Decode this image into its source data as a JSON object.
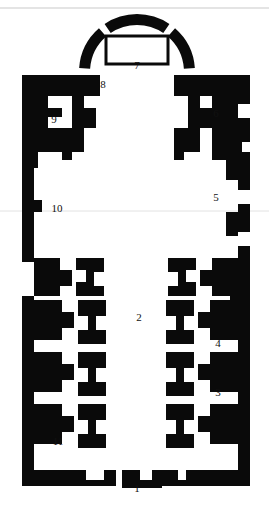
{
  "figure": {
    "kind": "architectural-floor-plan",
    "title": "",
    "orientation": "apse-at-top",
    "colors": {
      "masonry": "#0a0a0a",
      "background": "#ffffff",
      "altar_stroke": "#0a0a0a",
      "scan_artifact": "#c9c9c9"
    }
  },
  "labels": [
    {
      "id": "label-1",
      "text": "1",
      "x": 137,
      "y": 489,
      "refers_to": "main-entrance-portal"
    },
    {
      "id": "label-2",
      "text": "2",
      "x": 139,
      "y": 318,
      "refers_to": "nave"
    },
    {
      "id": "label-3",
      "text": "3",
      "x": 218,
      "y": 393,
      "refers_to": "right-aisle-bay-lower"
    },
    {
      "id": "label-4",
      "text": "4",
      "x": 218,
      "y": 344,
      "refers_to": "right-aisle-bay-upper"
    },
    {
      "id": "label-5",
      "text": "5",
      "x": 216,
      "y": 198,
      "refers_to": "right-transept-arm"
    },
    {
      "id": "label-6",
      "text": "6",
      "x": 216,
      "y": 114,
      "refers_to": "right-side-chapel"
    },
    {
      "id": "label-7",
      "text": "7",
      "x": 137,
      "y": 66,
      "refers_to": "altar"
    },
    {
      "id": "label-8",
      "text": "8",
      "x": 103,
      "y": 85,
      "refers_to": "apse-junction"
    },
    {
      "id": "label-9",
      "text": "9",
      "x": 54,
      "y": 120,
      "refers_to": "left-side-chapel"
    },
    {
      "id": "label-10",
      "text": "10",
      "x": 57,
      "y": 209,
      "refers_to": "left-transept-arm"
    },
    {
      "id": "label-11",
      "text": "11",
      "x": 58,
      "y": 442,
      "refers_to": "left-aisle-bay-lower"
    }
  ],
  "geometry": {
    "apse_arc": {
      "cx": 137,
      "cy": 72,
      "outer_r": 58,
      "inner_r": 47,
      "segments": [
        {
          "name": "apse-arc-left",
          "start_deg": 184,
          "end_deg": 229
        },
        {
          "name": "apse-arc-center",
          "start_deg": 236,
          "end_deg": 304
        },
        {
          "name": "apse-arc-right",
          "start_deg": 311,
          "end_deg": 356
        }
      ]
    },
    "altar_rect": {
      "x": 106,
      "y": 36,
      "w": 62,
      "h": 28
    },
    "wall_polygons": [
      {
        "name": "left-outer-wall-upper",
        "points": "22,75 62,75 62,96 48,96 48,108 62,108 62,117 48,117 48,128 62,128 62,152 38,152 38,168 34,168 34,260 22,260"
      },
      {
        "name": "left-wall-spur-upper",
        "points": "62,75 100,75 100,96 84,96 84,108 96,108 96,128 84,128 84,152 72,152 72,96 62,96"
      },
      {
        "name": "left-chapel-block",
        "points": "62,128 84,128 84,152 72,152 72,160 62,160"
      },
      {
        "name": "left-outer-wall-mid",
        "points": "22,172 34,172 34,200 42,200 42,212 34,212 34,262 22,262"
      },
      {
        "name": "left-pier-a",
        "points": "34,258 60,258 60,270 72,270 72,286 60,286 60,296 34,296"
      },
      {
        "name": "left-pier-b",
        "points": "76,258 104,258 104,272 94,272 94,286 104,286 104,296 76,296 76,282 86,282 86,270 76,270"
      },
      {
        "name": "left-outer-wall-lower",
        "points": "22,296 34,296 34,478 22,478"
      },
      {
        "name": "left-aisle-pier-c",
        "points": "34,300 62,300 62,312 74,312 74,328 62,328 62,340 34,340"
      },
      {
        "name": "left-aisle-pier-d",
        "points": "78,300 106,300 106,316 96,316 96,330 106,330 106,344 78,344 78,330 88,330 88,316 78,316"
      },
      {
        "name": "left-aisle-pier-e",
        "points": "34,352 62,352 62,364 74,364 74,380 62,380 62,392 34,392"
      },
      {
        "name": "left-aisle-pier-f",
        "points": "78,352 106,352 106,368 96,368 96,382 106,382 106,396 78,396 78,382 88,382 88,368 78,368"
      },
      {
        "name": "left-aisle-pier-g",
        "points": "34,404 62,404 62,416 74,416 74,432 62,432 62,444 34,444"
      },
      {
        "name": "left-aisle-pier-h",
        "points": "78,404 106,404 106,420 96,420 96,434 106,434 106,448 78,448 78,434 88,434 88,420 78,420"
      },
      {
        "name": "left-bottom-wall",
        "points": "22,456 34,456 34,470 86,470 86,480 104,480 104,470 116,470 116,486 22,486"
      },
      {
        "name": "bottom-wall-center-left",
        "points": "122,470 140,470 140,480 152,480 152,470 162,470 162,488 122,488"
      },
      {
        "name": "bottom-wall-center-right",
        "points": "166,470 178,470 178,480 196,480 196,470 210,470 210,486 166,486"
      },
      {
        "name": "right-outer-wall-upper",
        "points": "212,75 250,75 250,104 238,104 238,118 250,118 250,142 242,142 242,152 250,152 250,190 238,190 238,204 250,204 250,232 238,232 238,246 250,246 250,478 238,478 238,300 230,300 230,262 238,262 238,236 226,236 226,212 238,212 238,180 226,180 226,160 212,160"
      },
      {
        "name": "right-wall-spur-upper",
        "points": "174,75 212,75 212,96 200,96 200,108 212,108 212,128 200,128 200,152 188,152 188,96 174,96"
      },
      {
        "name": "right-chapel-block",
        "points": "174,128 196,128 196,152 184,152 184,160 174,160"
      },
      {
        "name": "right-pier-a",
        "points": "238,258 212,258 212,270 200,270 200,286 212,286 212,296 238,296"
      },
      {
        "name": "right-pier-b",
        "points": "196,258 168,258 168,272 178,272 178,286 168,286 168,296 196,296 196,282 186,282 186,270 196,270"
      },
      {
        "name": "right-aisle-pier-c",
        "points": "238,300 210,300 210,312 198,312 198,328 210,328 210,340 238,340"
      },
      {
        "name": "right-aisle-pier-d",
        "points": "194,300 166,300 166,316 176,316 176,330 166,330 166,344 194,344 194,330 184,330 184,316 194,316"
      },
      {
        "name": "right-aisle-pier-e",
        "points": "238,352 210,352 210,364 198,364 198,380 210,380 210,392 238,392"
      },
      {
        "name": "right-aisle-pier-f",
        "points": "194,352 166,352 166,368 176,368 176,382 166,382 166,396 194,396 194,382 184,382 184,368 194,368"
      },
      {
        "name": "right-aisle-pier-g",
        "points": "238,404 210,404 210,416 198,416 198,432 210,432 210,444 238,444"
      },
      {
        "name": "right-aisle-pier-h",
        "points": "194,404 166,404 166,420 176,420 176,434 166,434 166,448 194,448 194,434 184,434 184,420 194,420"
      },
      {
        "name": "right-bottom-wall",
        "points": "250,456 238,456 238,470 186,470 186,480 168,480 168,470 156,470 156,486 250,486"
      }
    ],
    "scan_artifacts": [
      {
        "name": "scanline-top",
        "x1": 0,
        "y1": 8,
        "x2": 269,
        "y2": 8,
        "faint": false
      },
      {
        "name": "scanline-middle",
        "x1": 0,
        "y1": 211,
        "x2": 269,
        "y2": 211,
        "faint": true
      }
    ]
  }
}
